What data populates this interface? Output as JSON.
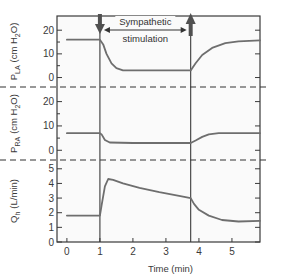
{
  "chart_data": {
    "type": "line",
    "title": "",
    "xlabel": "Time (min)",
    "xlim": [
      -0.3,
      5.85
    ],
    "x_ticks": [
      "0",
      "1",
      "2",
      "3",
      "4",
      "5"
    ],
    "annotation": {
      "text_line1": "Sympathetic",
      "text_line2": "stimulation",
      "start_min": 1.0,
      "end_min": 3.75,
      "start_marker": "down-arrow",
      "end_marker": "up-arrow"
    },
    "panels": [
      {
        "id": "pla",
        "ylabel": "P_LA (cm H2O)",
        "ylabel_main": "P",
        "ylabel_sub": "LA",
        "ylabel_unit_pre": "(cm H",
        "ylabel_unit_sub": "2",
        "ylabel_unit_post": "O)",
        "ylim": [
          -4,
          26
        ],
        "y_ticks": [
          "0",
          "10",
          "20"
        ],
        "series": [
          {
            "name": "Left atrial pressure",
            "x": [
              0,
              1.0,
              1.1,
              1.2,
              1.35,
              1.5,
              1.7,
              2.0,
              3.75,
              3.9,
              4.1,
              4.4,
              4.8,
              5.2,
              5.85
            ],
            "y": [
              16,
              16,
              14,
              10,
              6,
              4,
              3,
              3,
              3,
              6,
              9.5,
              12.5,
              14.5,
              15.3,
              15.7
            ]
          }
        ]
      },
      {
        "id": "pra",
        "ylabel": "P_RA (cm H2O)",
        "ylabel_main": "P",
        "ylabel_sub": "RA",
        "ylabel_unit_pre": "(cm H",
        "ylabel_unit_sub": "2",
        "ylabel_unit_post": "O)",
        "ylim": [
          -4,
          26
        ],
        "y_ticks": [
          "0",
          "10",
          "20"
        ],
        "series": [
          {
            "name": "Right atrial pressure",
            "x": [
              0,
              1.0,
              1.05,
              1.15,
              1.3,
              2.0,
              3.75,
              3.9,
              4.1,
              4.3,
              4.6,
              5.85
            ],
            "y": [
              7,
              7,
              6.5,
              4.2,
              3.2,
              3,
              3,
              4,
              5.5,
              6.5,
              7,
              7
            ]
          }
        ]
      },
      {
        "id": "qh",
        "ylabel": "Q_h (L/min)",
        "ylabel_main": "Q",
        "ylabel_sub": "h",
        "ylabel_unit_pre": "(L/min)",
        "ylim": [
          0,
          5.6
        ],
        "y_ticks": [
          "0",
          "1",
          "2",
          "3",
          "4",
          "5"
        ],
        "series": [
          {
            "name": "Cardiac output",
            "x": [
              0,
              1.0,
              1.05,
              1.15,
              1.25,
              1.4,
              1.7,
              2.2,
              2.8,
              3.4,
              3.75,
              3.85,
              4.0,
              4.3,
              4.7,
              5.2,
              5.85
            ],
            "y": [
              1.8,
              1.8,
              2.5,
              3.8,
              4.3,
              4.25,
              4.0,
              3.7,
              3.4,
              3.15,
              3.0,
              2.6,
              2.2,
              1.8,
              1.5,
              1.4,
              1.45
            ]
          }
        ]
      }
    ],
    "layout": {
      "grid": false,
      "legend": "none",
      "panel_separator": "dashed",
      "line_color": "#6e6e6e",
      "frame_color": "#3a3a3a",
      "event_line_color": "#3a3a3a",
      "arrow_color": "#505050"
    }
  }
}
